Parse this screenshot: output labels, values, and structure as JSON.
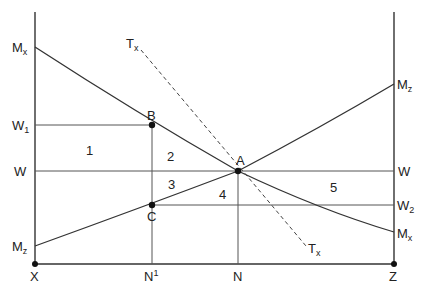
{
  "diagram": {
    "axes": {
      "left_origin": "X",
      "right_origin": "Z"
    },
    "curves": {
      "mx": {
        "label_left": "M",
        "sub_left": "x",
        "label_right": "M",
        "sub_right": "x"
      },
      "mz": {
        "label_left": "M",
        "sub_left": "z",
        "label_right": "M",
        "sub_right": "z"
      },
      "tx": {
        "label_top": "T",
        "sub_top": "x",
        "label_bottom": "T",
        "sub_bottom": "x"
      }
    },
    "wage_lines": {
      "w1": {
        "label": "W",
        "sub": "1"
      },
      "w": {
        "label_left": "W",
        "label_right": "W"
      },
      "w2": {
        "label": "W",
        "sub": "2"
      }
    },
    "points": {
      "a": "A",
      "b": "B",
      "c": "C"
    },
    "x_ticks": {
      "n1": {
        "label": "N",
        "sup": "1"
      },
      "n": "N"
    },
    "regions": [
      "1",
      "2",
      "3",
      "4",
      "5"
    ]
  }
}
